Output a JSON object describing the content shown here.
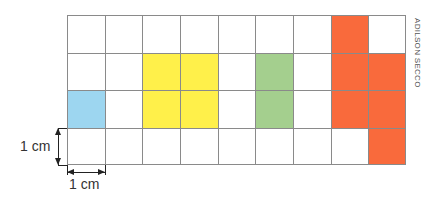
{
  "figure": {
    "grid": {
      "columns": 9,
      "rows": 4,
      "line_color": "#8a8a8a"
    },
    "shapes": [
      {
        "name": "blue-shape",
        "color": "#9dd6f0",
        "cells": [
          [
            0,
            2
          ]
        ]
      },
      {
        "name": "yellow-shape",
        "color": "#fff04a",
        "cells": [
          [
            2,
            1
          ],
          [
            3,
            1
          ],
          [
            2,
            2
          ],
          [
            3,
            2
          ]
        ]
      },
      {
        "name": "green-shape",
        "color": "#a4cf8e",
        "cells": [
          [
            5,
            1
          ],
          [
            5,
            2
          ]
        ]
      },
      {
        "name": "orange-shape",
        "color": "#f96a3c",
        "cells": [
          [
            7,
            0
          ],
          [
            7,
            1
          ],
          [
            8,
            1
          ],
          [
            7,
            2
          ],
          [
            8,
            2
          ],
          [
            8,
            3
          ]
        ]
      }
    ],
    "scale": {
      "vertical_label": "1 cm",
      "horizontal_label": "1 cm"
    },
    "credit": "ADILSON SECCO"
  }
}
